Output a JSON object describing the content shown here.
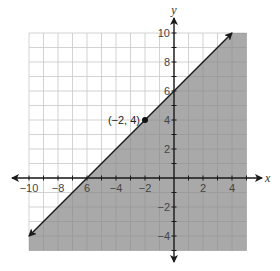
{
  "chart_data": {
    "type": "line",
    "title": "",
    "xlabel": "x",
    "ylabel": "y",
    "xlim": [
      -10,
      5
    ],
    "ylim": [
      -5,
      10
    ],
    "grid": true,
    "x_ticks": [
      -10,
      -8,
      -6,
      -4,
      -2,
      2,
      4
    ],
    "y_ticks": [
      -4,
      -2,
      2,
      4,
      6,
      8,
      10
    ],
    "x_tick_labels": [
      "−10",
      "−8",
      "6",
      "−4",
      "−2",
      "2",
      "4"
    ],
    "y_tick_labels": [
      "−4",
      "−2",
      "2",
      "4",
      "6",
      "8",
      "10"
    ],
    "boundary_line": {
      "equation": "y = x + 6",
      "slope": 1,
      "y_intercept": 6,
      "x_intercept": -6,
      "style": "solid",
      "arrows": "both"
    },
    "shaded_region": "below line (y ≤ x + 6)",
    "shade_color": "#a9a9a9",
    "labeled_point": {
      "x": -2,
      "y": 4,
      "label": "(−2, 4)"
    },
    "series": [
      {
        "name": "boundary",
        "x": [
          -10,
          4
        ],
        "y": [
          -4,
          10
        ]
      }
    ]
  },
  "axes": {
    "x_name": "x",
    "y_name": "y"
  },
  "colors": {
    "grid": "#c8c8c8",
    "shade": "#a9a9a9",
    "shade_grid": "#999999",
    "axis": "#1a1a1a"
  }
}
